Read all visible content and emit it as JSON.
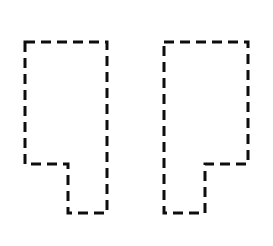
{
  "canvas": {
    "width": 273,
    "height": 246,
    "background_color": "#ffffff",
    "title": "Two dashed L-shaped outlines"
  },
  "style": {
    "stroke_color": "#0d0d0d",
    "stroke_width": 3,
    "dash_length": 10,
    "gap_length": 6,
    "fill": "none",
    "line_cap": "butt",
    "line_join": "miter"
  },
  "shapes": [
    {
      "id": "left-shape",
      "name": "left-dashed-polygon",
      "description": "L-shaped hexagonal outline with a notch cut from the lower-left",
      "orientation": "notch-lower-left",
      "points": [
        [
          25,
          42
        ],
        [
          107,
          42
        ],
        [
          107,
          213
        ],
        [
          68,
          213
        ],
        [
          68,
          164
        ],
        [
          25,
          164
        ]
      ],
      "bbox": {
        "x": 25,
        "y": 42,
        "width": 82,
        "height": 171
      },
      "vertex_count": 6
    },
    {
      "id": "right-shape",
      "name": "right-dashed-polygon",
      "description": "L-shaped hexagonal outline, mirrored, with a notch cut from the lower-right",
      "orientation": "notch-lower-right",
      "points": [
        [
          164,
          42
        ],
        [
          248,
          42
        ],
        [
          248,
          164
        ],
        [
          205,
          164
        ],
        [
          205,
          213
        ],
        [
          164,
          213
        ]
      ],
      "bbox": {
        "x": 164,
        "y": 42,
        "width": 84,
        "height": 171
      },
      "vertex_count": 6
    }
  ]
}
